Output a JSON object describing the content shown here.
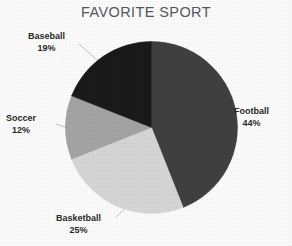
{
  "chart_data": {
    "type": "pie",
    "title": "FAVORITE SPORT",
    "xlabel": "",
    "ylabel": "",
    "legend": "none",
    "grid": false,
    "labels_outside": true,
    "leader_lines": true,
    "categories": [
      "Football",
      "Basketball",
      "Soccer",
      "Baseball"
    ],
    "values": [
      44,
      25,
      12,
      19
    ],
    "value_suffix": "%",
    "start_angle_deg": 0,
    "direction": "clockwise",
    "slices": [
      {
        "label": "Football",
        "percent_text": "44%",
        "value": 44,
        "color": "#414141"
      },
      {
        "label": "Basketball",
        "percent_text": "25%",
        "value": 25,
        "color": "#d9d9d9"
      },
      {
        "label": "Soccer",
        "percent_text": "12%",
        "value": 12,
        "color": "#a6a6a6"
      },
      {
        "label": "Baseball",
        "percent_text": "19%",
        "value": 19,
        "color": "#1a1a1a"
      }
    ]
  },
  "style": {
    "background": "#ffffff",
    "title_color": "#59595c",
    "label_color": "#2b2b2b",
    "leader_line_color": "#bdbdbd"
  }
}
